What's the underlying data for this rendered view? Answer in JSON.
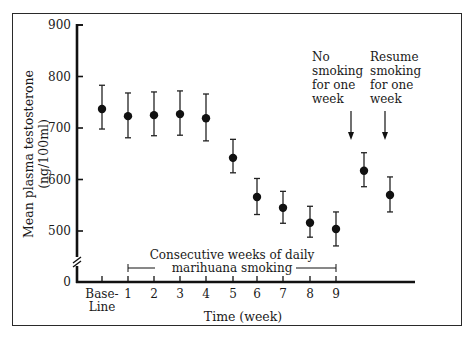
{
  "chart_data": {
    "type": "scatter",
    "title": "",
    "xlabel": "Time (week)",
    "ylabel": "Mean plasma testosterone (ng/100ml)",
    "ylabel_lines": [
      "Mean plasma testosterone",
      "(ng/100ml)"
    ],
    "ylim": [
      0,
      900
    ],
    "y_axis_break": true,
    "yticks": [
      0,
      500,
      600,
      700,
      800,
      900
    ],
    "x_tick_labels": [
      "Base-\nLine",
      "1",
      "2",
      "3",
      "4",
      "5",
      "6",
      "7",
      "8",
      "9"
    ],
    "x_tick_labels_display": [
      {
        "line1": "Base-",
        "line2": "Line"
      },
      {
        "line1": "1"
      },
      {
        "line1": "2"
      },
      {
        "line1": "3"
      },
      {
        "line1": "4"
      },
      {
        "line1": "5"
      },
      {
        "line1": "6"
      },
      {
        "line1": "7"
      },
      {
        "line1": "8"
      },
      {
        "line1": "9"
      }
    ],
    "grid": false,
    "legend": null,
    "series": [
      {
        "name": "Mean plasma testosterone",
        "marker": "filled-circle-with-error-bars",
        "points": [
          {
            "x": "Baseline",
            "y": 737,
            "err_low": 698,
            "err_high": 783
          },
          {
            "x": "1",
            "y": 723,
            "err_low": 681,
            "err_high": 768
          },
          {
            "x": "2",
            "y": 725,
            "err_low": 685,
            "err_high": 770
          },
          {
            "x": "3",
            "y": 727,
            "err_low": 686,
            "err_high": 772
          },
          {
            "x": "4",
            "y": 719,
            "err_low": 675,
            "err_high": 766
          },
          {
            "x": "5",
            "y": 642,
            "err_low": 613,
            "err_high": 678
          },
          {
            "x": "6",
            "y": 566,
            "err_low": 532,
            "err_high": 602
          },
          {
            "x": "7",
            "y": 545,
            "err_low": 515,
            "err_high": 577
          },
          {
            "x": "8",
            "y": 516,
            "err_low": 488,
            "err_high": 548
          },
          {
            "x": "9",
            "y": 504,
            "err_low": 471,
            "err_high": 537
          },
          {
            "x": "No smoking week",
            "y": 617,
            "err_low": 586,
            "err_high": 652
          },
          {
            "x": "Resume smoking week",
            "y": 570,
            "err_low": 537,
            "err_high": 605
          }
        ]
      }
    ],
    "annotations": {
      "consecutive_weeks": {
        "lines": [
          "Consecutive weeks of daily",
          "marihuana smoking"
        ],
        "span": [
          "1",
          "9"
        ]
      },
      "no_smoking": {
        "lines": [
          "No",
          "smoking",
          "for one",
          "week"
        ],
        "arrow": "down"
      },
      "resume_smoking": {
        "lines": [
          "Resume",
          "smoking",
          "for one",
          "week"
        ],
        "arrow": "down"
      }
    }
  }
}
